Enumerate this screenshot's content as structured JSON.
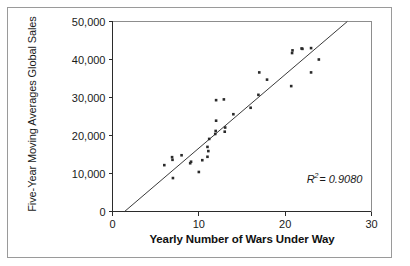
{
  "chart_data": {
    "type": "scatter",
    "title": "",
    "xlabel": "Yearly Number of Wars Under Way",
    "ylabel": "Five-Year Moving Averages Global Sales",
    "xlim": [
      0,
      30
    ],
    "ylim": [
      0,
      50000
    ],
    "grid": false,
    "legend": null,
    "xticks": [
      0,
      10,
      20,
      30
    ],
    "xticklabels": [
      "0",
      "10",
      "20",
      "30"
    ],
    "yticks": [
      0,
      10000,
      20000,
      30000,
      40000,
      50000
    ],
    "yticklabels": [
      "0",
      "10,000",
      "20,000",
      "30,000",
      "40,000",
      "50,000"
    ],
    "annotation": {
      "r_symbol": "R",
      "exponent": "2",
      "equals_value": "= 0.9080",
      "full_text": "R2 = 0.9080",
      "r_squared": 0.908,
      "x": 22.5,
      "y": 7600
    },
    "trendline": {
      "type": "linear",
      "x_start": 1.4,
      "y_start": 0,
      "x_end": 27.2,
      "y_end": 50000,
      "slope": 1938,
      "intercept": -2713
    },
    "points": [
      {
        "x": 6.0,
        "y": 12200
      },
      {
        "x": 6.9,
        "y": 14300
      },
      {
        "x": 6.95,
        "y": 13600
      },
      {
        "x": 7.0,
        "y": 8800
      },
      {
        "x": 8.0,
        "y": 14800
      },
      {
        "x": 9.0,
        "y": 12700
      },
      {
        "x": 9.1,
        "y": 13100
      },
      {
        "x": 10.0,
        "y": 10400
      },
      {
        "x": 10.4,
        "y": 13500
      },
      {
        "x": 11.0,
        "y": 14400
      },
      {
        "x": 11.0,
        "y": 17000
      },
      {
        "x": 11.1,
        "y": 15900
      },
      {
        "x": 11.2,
        "y": 19100
      },
      {
        "x": 11.9,
        "y": 20400
      },
      {
        "x": 11.95,
        "y": 21200
      },
      {
        "x": 12.0,
        "y": 23900
      },
      {
        "x": 12.0,
        "y": 29300
      },
      {
        "x": 12.9,
        "y": 29500
      },
      {
        "x": 13.0,
        "y": 21000
      },
      {
        "x": 13.05,
        "y": 22100
      },
      {
        "x": 14.0,
        "y": 25600
      },
      {
        "x": 16.0,
        "y": 27300
      },
      {
        "x": 16.9,
        "y": 30700
      },
      {
        "x": 17.0,
        "y": 36600
      },
      {
        "x": 17.9,
        "y": 34700
      },
      {
        "x": 20.7,
        "y": 33000
      },
      {
        "x": 20.8,
        "y": 41700
      },
      {
        "x": 20.85,
        "y": 42400
      },
      {
        "x": 21.9,
        "y": 42900
      },
      {
        "x": 22.0,
        "y": 42800
      },
      {
        "x": 23.0,
        "y": 43000
      },
      {
        "x": 23.0,
        "y": 36600
      },
      {
        "x": 23.9,
        "y": 40000
      }
    ]
  },
  "figure": {
    "background_color": "#ffffff",
    "frame_color": "#9a9a9a",
    "axis_color": "#2b2b2b",
    "marker_color": "#2a2a2a",
    "trendline_color": "#3a3a3a"
  }
}
